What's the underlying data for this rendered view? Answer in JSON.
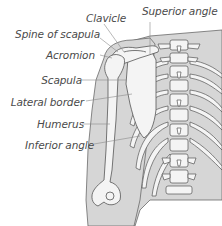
{
  "labels": {
    "clavicle": "Clavicle",
    "superior_angle": "Superior angle",
    "spine_of_scapula": "Spine of scapula",
    "acromion": "Acromion",
    "scapula": "Scapula",
    "lateral_border": "Lateral border",
    "humerus": "Humerus",
    "inferior_angle": "Inferior angle"
  },
  "colors": {
    "skin_fill": "#d6d6d6",
    "bone_fill": "#f4f4f4",
    "outline": "#555555",
    "leader_line": "#8a8a8a",
    "label_text": "#4a4a4a"
  }
}
